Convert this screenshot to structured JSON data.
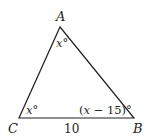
{
  "diagram": {
    "type": "triangle",
    "vertices": [
      {
        "name": "A",
        "x": 60,
        "y": 27
      },
      {
        "name": "B",
        "x": 134,
        "y": 118
      },
      {
        "name": "C",
        "x": 19,
        "y": 118
      }
    ],
    "vertex_labels": {
      "A": "A",
      "B": "B",
      "C": "C"
    },
    "angles": {
      "A": {
        "var": "x",
        "deg": "°"
      },
      "C": {
        "var": "x",
        "deg": "°"
      },
      "B": {
        "open": "(",
        "var": "x",
        "op": " − 15)",
        "deg": "°"
      }
    },
    "sides": {
      "CB": "10"
    },
    "stroke_color": "#231f20"
  }
}
